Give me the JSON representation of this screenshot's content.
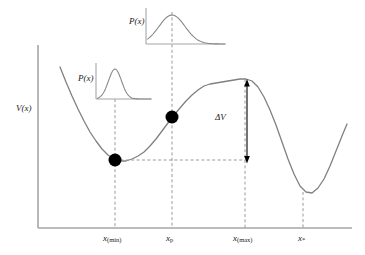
{
  "figure": {
    "background_color": "#ffffff",
    "curve_color": "#808080",
    "axis_color": "#a6a6a6",
    "dash_color": "#9a9a9a",
    "marker_color": "#000000",
    "arrow_color": "#000000"
  },
  "axes": {
    "ylabel": "V(x)",
    "xlabel": "",
    "origin_x": 38,
    "origin_y": 228,
    "x_axis_end": 352,
    "y_axis_top": 45,
    "grid": false
  },
  "tick_labels": [
    {
      "name": "x-min",
      "base": "x",
      "sub": "(min)",
      "x": 115
    },
    {
      "name": "x-p",
      "base": "x",
      "sub": "p",
      "x": 172
    },
    {
      "name": "x-max",
      "base": "x",
      "sub": "(max)",
      "x": 245
    },
    {
      "name": "x-star",
      "base": "x",
      "sub": "*",
      "x": 303
    }
  ],
  "annotations": {
    "delta_v_label": "ΔV",
    "delta_v_top_y": 83,
    "delta_v_bottom_y": 160,
    "delta_v_x": 247
  },
  "insets": [
    {
      "name": "upper-inset",
      "label": "P(x)",
      "label_x": 129,
      "label_y": 22,
      "box_left": 146,
      "box_top": 8,
      "box_width": 80,
      "box_height": 36,
      "peak_x": 172,
      "peak_sharpness": "broad",
      "description": "broad gaussian probability distribution centered at x_p"
    },
    {
      "name": "lower-inset",
      "label": "P(x)",
      "label_x": 78,
      "label_y": 79,
      "box_left": 96,
      "box_top": 63,
      "box_width": 56,
      "box_height": 36,
      "peak_x": 115,
      "peak_sharpness": "narrow",
      "description": "narrow gaussian probability distribution centered at x_(min)"
    }
  ],
  "markers": [
    {
      "name": "particle-at-min",
      "x": 115,
      "y": 160,
      "radius": 6.5
    },
    {
      "name": "particle-at-xp",
      "x": 172,
      "y": 117,
      "radius": 6.5
    }
  ],
  "chart_data": {
    "type": "line",
    "title": "",
    "xlabel": "",
    "ylabel": "V(x)",
    "series": [
      {
        "name": "V(x)",
        "description": "double-well potential: local minimum at x_(min), local maximum at x_(max), global minimum at x*",
        "points": [
          [
            60,
            67
          ],
          [
            66,
            82
          ],
          [
            72,
            96
          ],
          [
            78,
            109
          ],
          [
            84,
            121
          ],
          [
            90,
            132
          ],
          [
            96,
            141
          ],
          [
            102,
            149
          ],
          [
            108,
            155
          ],
          [
            114,
            159
          ],
          [
            120,
            161
          ],
          [
            126,
            161
          ],
          [
            132,
            159
          ],
          [
            138,
            156
          ],
          [
            144,
            152
          ],
          [
            150,
            146
          ],
          [
            156,
            139
          ],
          [
            162,
            131
          ],
          [
            168,
            123
          ],
          [
            174,
            115
          ],
          [
            180,
            108
          ],
          [
            186,
            101
          ],
          [
            192,
            95
          ],
          [
            198,
            90
          ],
          [
            204,
            86
          ],
          [
            210,
            84
          ],
          [
            216,
            83
          ],
          [
            222,
            82
          ],
          [
            228,
            81
          ],
          [
            234,
            80
          ],
          [
            240,
            79
          ],
          [
            246,
            79
          ],
          [
            252,
            81
          ],
          [
            258,
            87
          ],
          [
            264,
            97
          ],
          [
            270,
            110
          ],
          [
            276,
            125
          ],
          [
            282,
            142
          ],
          [
            288,
            159
          ],
          [
            294,
            174
          ],
          [
            300,
            186
          ],
          [
            306,
            192
          ],
          [
            312,
            193
          ],
          [
            318,
            188
          ],
          [
            324,
            179
          ],
          [
            330,
            166
          ],
          [
            336,
            151
          ],
          [
            342,
            136
          ],
          [
            347,
            124
          ]
        ]
      }
    ],
    "key_points": [
      {
        "label": "x_(min)",
        "x": 115,
        "y": 160,
        "kind": "local-minimum"
      },
      {
        "label": "x_p",
        "x": 172,
        "y": 117,
        "kind": "intermediate-point"
      },
      {
        "label": "x_(max)",
        "x": 245,
        "y": 79,
        "kind": "local-maximum"
      },
      {
        "label": "x*",
        "x": 303,
        "y": 192,
        "kind": "global-minimum"
      }
    ],
    "barrier": {
      "label": "ΔV",
      "from_y": 160,
      "to_y": 79
    }
  }
}
